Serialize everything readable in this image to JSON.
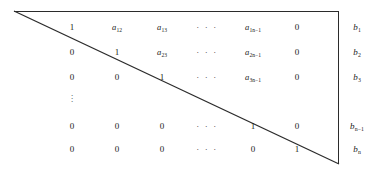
{
  "figure": {
    "kind": "upper-triangular-matrix-diagram",
    "columns_x": [
      72,
      117,
      162,
      207,
      253,
      297
    ],
    "rows_y": [
      27,
      52,
      77,
      126,
      149
    ],
    "b_column_x": 357,
    "stroke_color": "#2b2b2b",
    "background": "#ffffff",
    "diagonal": {
      "x1": 14,
      "y1": 11,
      "x2": 339,
      "y2": 164
    },
    "vertical_dots": "⋮"
  },
  "matrix": {
    "rows": [
      {
        "cells": [
          {
            "text": "1",
            "type": "num"
          },
          {
            "base": "a",
            "sub": "12",
            "type": "sym"
          },
          {
            "base": "a",
            "sub": "13",
            "type": "sym"
          },
          {
            "text": "· · ·",
            "type": "dots"
          },
          {
            "base": "a",
            "sub": "1n−1",
            "type": "sym"
          },
          {
            "text": "0",
            "type": "num"
          }
        ],
        "rhs": {
          "base": "b",
          "sub": "1"
        }
      },
      {
        "cells": [
          {
            "text": "0",
            "type": "num"
          },
          {
            "text": "1",
            "type": "num"
          },
          {
            "base": "a",
            "sub": "23",
            "type": "sym"
          },
          {
            "text": "· · ·",
            "type": "dots"
          },
          {
            "base": "a",
            "sub": "2n−1",
            "type": "sym"
          },
          {
            "text": "0",
            "type": "num"
          }
        ],
        "rhs": {
          "base": "b",
          "sub": "2"
        }
      },
      {
        "cells": [
          {
            "text": "0",
            "type": "num"
          },
          {
            "text": "0",
            "type": "num"
          },
          {
            "text": "1",
            "type": "num"
          },
          {
            "text": "· · ·",
            "type": "dots"
          },
          {
            "base": "a",
            "sub": "3n−1",
            "type": "sym"
          },
          {
            "text": "0",
            "type": "num"
          }
        ],
        "rhs": {
          "base": "b",
          "sub": "3"
        }
      },
      {
        "cells": [
          {
            "text": "0",
            "type": "num"
          },
          {
            "text": "0",
            "type": "num"
          },
          {
            "text": "0",
            "type": "num"
          },
          {
            "text": "· · ·",
            "type": "dots"
          },
          {
            "text": "1",
            "type": "num"
          },
          {
            "text": "0",
            "type": "num"
          }
        ],
        "rhs": {
          "base": "b",
          "sub": "n−1"
        }
      },
      {
        "cells": [
          {
            "text": "0",
            "type": "num"
          },
          {
            "text": "0",
            "type": "num"
          },
          {
            "text": "0",
            "type": "num"
          },
          {
            "text": "· · ·",
            "type": "dots"
          },
          {
            "text": "0",
            "type": "num"
          },
          {
            "text": "1",
            "type": "num"
          }
        ],
        "rhs": {
          "base": "b",
          "sub": "n"
        }
      }
    ]
  }
}
